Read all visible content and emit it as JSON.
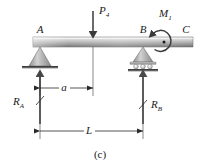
{
  "figure": {
    "caption": "(c)",
    "type": "free-body-diagram"
  },
  "colors": {
    "beam_light": "#e8e8e8",
    "beam_mid": "#b5b5b5",
    "beam_dark": "#7a7a7a",
    "support_fill": "#b0b0b0",
    "ink": "#1a1a1a",
    "ground": "#3a3a3a",
    "background": "#ffffff"
  },
  "points": [
    {
      "id": "A",
      "label": "A",
      "x": 40,
      "y": 33,
      "support": "pin"
    },
    {
      "id": "B",
      "label": "B",
      "x": 143,
      "y": 33,
      "support": "roller"
    },
    {
      "id": "C",
      "label": "C",
      "x": 186,
      "y": 33,
      "support": "free-end"
    }
  ],
  "loads": [
    {
      "id": "P4",
      "label": "P",
      "subscript": "4",
      "kind": "point-load",
      "direction": "down",
      "apply_x": 93,
      "label_x": 99,
      "label_y": 13
    },
    {
      "id": "M1",
      "label": "M",
      "subscript": "1",
      "kind": "moment",
      "direction": "counterclockwise",
      "apply_x": 164,
      "label_x": 159,
      "label_y": 16
    }
  ],
  "reactions": [
    {
      "id": "RA",
      "label": "R",
      "subscript": "A",
      "direction": "up",
      "arrow_x": 40,
      "label_x": 15,
      "label_y": 104
    },
    {
      "id": "RB",
      "label": "R",
      "subscript": "B",
      "direction": "up",
      "arrow_x": 143,
      "label_x": 152,
      "label_y": 104
    }
  ],
  "dimensions": [
    {
      "id": "a",
      "label": "a",
      "from": "A",
      "to": "P4",
      "x1": 40,
      "x2": 93,
      "y": 88,
      "label_x": 64,
      "label_y": 91
    },
    {
      "id": "L",
      "label": "L",
      "from": "A",
      "to": "B",
      "x1": 40,
      "x2": 143,
      "y": 131,
      "label_x": 89,
      "label_y": 134
    }
  ],
  "beam": {
    "x_left": 33,
    "x_right": 193,
    "y_top": 37,
    "height": 10
  }
}
